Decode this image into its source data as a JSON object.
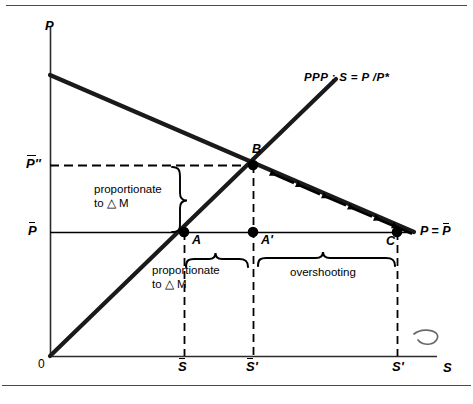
{
  "figure": {
    "background": "#ffffff",
    "ink": "#000000",
    "width": 473,
    "height": 404
  },
  "axes": {
    "y_axis_label": "P",
    "x_axis_label": "S",
    "origin_label": "0",
    "y_ticks": [
      {
        "label": "P̄'",
        "text": "P'",
        "overbar": true,
        "y_px": 165
      },
      {
        "label": "P̄",
        "text": "P",
        "overbar": true,
        "y_px": 232
      }
    ],
    "x_ticks": [
      {
        "label": "S̄",
        "text": "S",
        "overbar": true,
        "prime": false,
        "x_px": 184
      },
      {
        "label": "S̄'",
        "text": "S",
        "overbar": true,
        "prime": true,
        "x_px": 253
      },
      {
        "label": "S'",
        "text": "S",
        "overbar": false,
        "prime": true,
        "x_px": 397
      }
    ]
  },
  "lines": [
    {
      "name": "ppp-line",
      "label": "PPP : S = P /P*",
      "label_parts": {
        "name": "PPP",
        "separator": ":",
        "equation": "S = P /P*"
      },
      "description": "upward sloping purchasing power parity schedule from origin",
      "slope": "positive"
    },
    {
      "name": "money-market-line",
      "label": "",
      "description": "downward sloping schedule with adjustment arrows pointing up-left toward B",
      "slope": "negative",
      "arrow_count": 6
    }
  ],
  "points": [
    {
      "name": "point-a",
      "label": "A",
      "x_px": 184,
      "y_px": 232,
      "filled": true
    },
    {
      "name": "point-a-prime",
      "label": "A'",
      "x_px": 253,
      "y_px": 232,
      "filled": true
    },
    {
      "name": "point-b",
      "label": "B",
      "x_px": 253,
      "y_px": 165,
      "filled": true
    },
    {
      "name": "point-c",
      "label": "C",
      "x_px": 397,
      "y_px": 232,
      "filled": true
    }
  ],
  "annotations": {
    "price_level_line": {
      "name": "p-equals-pbar-label",
      "text": "P = P̄",
      "lhs": "P =",
      "rhs": "P"
    },
    "vertical_brace": {
      "name": "proportionate-vertical",
      "line1": "proportionate",
      "line2": "to △ M"
    },
    "horizontal_brace": {
      "name": "proportionate-horizontal",
      "line1": "proportionate",
      "line2": "to △ M"
    },
    "overshooting": {
      "name": "overshooting-label",
      "text": "overshooting"
    },
    "margin_mark": {
      "name": "handwritten-curl-mark",
      "text": ""
    }
  }
}
